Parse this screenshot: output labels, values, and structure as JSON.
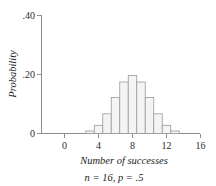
{
  "chart_data": {
    "type": "bar",
    "title": "",
    "subtitle": "",
    "xlabel": "Number of successes",
    "ylabel": "Probability",
    "caption": "n = 16, p = .5",
    "grid": false,
    "legend": "none",
    "xlim": [
      -2,
      17
    ],
    "ylim": [
      0,
      0.44
    ],
    "x_tick_labels": [
      "0",
      "4",
      "8",
      "12",
      "16"
    ],
    "x_tick_values": [
      0,
      4,
      8,
      12,
      16
    ],
    "y_tick_labels": [
      "0",
      ".20",
      ".40"
    ],
    "y_tick_values": [
      0,
      0.2,
      0.4
    ],
    "bar_colors": {
      "fill": "#f4f4f4",
      "stroke": "#9a9a9a"
    },
    "axis_color": "#8d8d8d",
    "categories": [
      3,
      4,
      5,
      6,
      7,
      8,
      9,
      10,
      11,
      12,
      13
    ],
    "values": [
      0.0085,
      0.0278,
      0.0667,
      0.1222,
      0.1746,
      0.1964,
      0.1746,
      0.1222,
      0.0667,
      0.0278,
      0.0085
    ],
    "series": [
      {
        "name": "Binomial probability",
        "values": [
          0.0085,
          0.0278,
          0.0667,
          0.1222,
          0.1746,
          0.1964,
          0.1746,
          0.1222,
          0.0667,
          0.0278,
          0.0085
        ]
      }
    ]
  },
  "labels": {
    "y_tick_40": ".40",
    "y_tick_20": ".20",
    "y_tick_0": "0",
    "x_tick_0": "0",
    "x_tick_4": "4",
    "x_tick_8": "8",
    "x_tick_12": "12",
    "x_tick_16": "16",
    "x_axis_title": "Number of successes",
    "y_axis_title": "Probability",
    "caption": "n = 16, p = .5"
  }
}
